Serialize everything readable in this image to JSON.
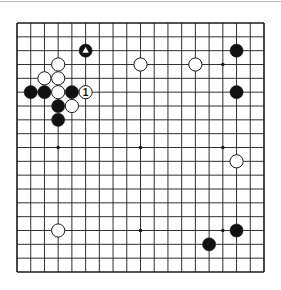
{
  "diagram": {
    "type": "go-board",
    "board_size": 19,
    "colors": {
      "background": "#ffffff",
      "grid": "#1a1a1a",
      "black_stone": "#111111",
      "white_stone": "#ffffff",
      "stone_outline": "#1a1a1a",
      "top_rule": "#b8b8b8"
    },
    "geometry": {
      "left": 17,
      "top": 23,
      "right": 264,
      "bottom": 272,
      "stone_radius": 6.6
    },
    "hoshi": [
      {
        "col": 3,
        "row": 3
      },
      {
        "col": 9,
        "row": 3
      },
      {
        "col": 15,
        "row": 3
      },
      {
        "col": 3,
        "row": 9
      },
      {
        "col": 9,
        "row": 9
      },
      {
        "col": 15,
        "row": 9
      },
      {
        "col": 3,
        "row": 15
      },
      {
        "col": 9,
        "row": 15
      },
      {
        "col": 15,
        "row": 15
      }
    ],
    "stones": [
      {
        "color": "black",
        "col": 5,
        "row": 2,
        "marker": "triangle"
      },
      {
        "color": "white",
        "col": 3,
        "row": 3
      },
      {
        "color": "white",
        "col": 9,
        "row": 3
      },
      {
        "color": "white",
        "col": 13,
        "row": 3
      },
      {
        "color": "black",
        "col": 16,
        "row": 2
      },
      {
        "color": "white",
        "col": 2,
        "row": 4
      },
      {
        "color": "white",
        "col": 3,
        "row": 4
      },
      {
        "color": "black",
        "col": 1,
        "row": 5
      },
      {
        "color": "black",
        "col": 2,
        "row": 5
      },
      {
        "color": "white",
        "col": 3,
        "row": 5
      },
      {
        "color": "black",
        "col": 4,
        "row": 5
      },
      {
        "color": "white",
        "col": 5,
        "row": 5,
        "label": "1"
      },
      {
        "color": "black",
        "col": 16,
        "row": 5
      },
      {
        "color": "black",
        "col": 3,
        "row": 6
      },
      {
        "color": "white",
        "col": 4,
        "row": 6
      },
      {
        "color": "black",
        "col": 3,
        "row": 7
      },
      {
        "color": "white",
        "col": 16,
        "row": 10
      },
      {
        "color": "white",
        "col": 3,
        "row": 15
      },
      {
        "color": "black",
        "col": 16,
        "row": 15
      },
      {
        "color": "black",
        "col": 14,
        "row": 16
      }
    ]
  }
}
